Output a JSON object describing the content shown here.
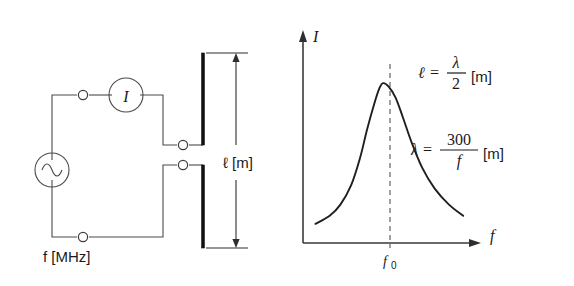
{
  "figure": {
    "background_color": "#ffffff",
    "ink_color": "#1a1a1a"
  },
  "circuit": {
    "name": "dipole-antenna-measurement-circuit",
    "source": {
      "symbol": "ac-source",
      "glyph": "sine",
      "label": "f [MHz]",
      "label_variable": "f",
      "label_unit": "[MHz]"
    },
    "meter": {
      "symbol": "ammeter",
      "glyph": "I",
      "label": "I"
    },
    "antenna": {
      "symbol": "dipole-antenna",
      "dimension_label": "ℓ [m]",
      "dimension_variable": "ℓ",
      "dimension_unit": "[m]"
    },
    "terminals_count": 4
  },
  "chart_data": {
    "type": "line",
    "title": "",
    "xlabel": "f",
    "ylabel": "I",
    "xticks": [
      "f₀"
    ],
    "xtick_values": [
      1.0
    ],
    "yticks": [],
    "grid": false,
    "legend": null,
    "xlim": [
      0.55,
      1.55
    ],
    "ylim": [
      0,
      1.12
    ],
    "series": [
      {
        "name": "antenna current resonance",
        "x": [
          0.62,
          0.7,
          0.76,
          0.82,
          0.87,
          0.91,
          0.95,
          0.98,
          1.0,
          1.03,
          1.07,
          1.11,
          1.16,
          1.22,
          1.29,
          1.37,
          1.45
        ],
        "y": [
          0.12,
          0.17,
          0.24,
          0.36,
          0.53,
          0.71,
          0.87,
          0.97,
          1.0,
          0.98,
          0.91,
          0.79,
          0.63,
          0.47,
          0.34,
          0.24,
          0.17
        ]
      }
    ],
    "annotations": [
      {
        "name": "peak-marker",
        "type": "vertical-dashed-line",
        "x": 1.0,
        "label": "f₀"
      }
    ]
  },
  "formulas": [
    {
      "name": "antenna-length-formula",
      "lhs": "ℓ",
      "equals": "=",
      "numerator": "λ",
      "denominator": "2",
      "unit": "[m]",
      "plain": "ℓ = λ/2 [m]"
    },
    {
      "name": "wavelength-formula",
      "lhs": "λ",
      "equals": "=",
      "numerator": "300",
      "denominator": "f",
      "unit": "[m]",
      "plain": "λ = 300/f [m]"
    }
  ],
  "axis_labels": {
    "y_axis": "I",
    "x_axis": "f",
    "x_tick_main": "f",
    "x_tick_sub": "0"
  }
}
